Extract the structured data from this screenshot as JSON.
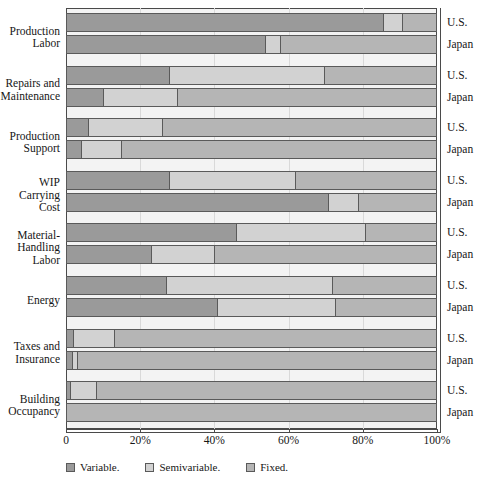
{
  "chart_data": {
    "type": "bar",
    "orientation": "horizontal",
    "stacked": true,
    "normalized": true,
    "title": "",
    "xlabel": "",
    "ylabel": "",
    "xlim": [
      0,
      100
    ],
    "grid": true,
    "legend_position": "bottom",
    "xticks": [
      "0",
      "20%",
      "40%",
      "60%",
      "80%",
      "100%"
    ],
    "xtick_values": [
      0,
      20,
      40,
      60,
      80,
      100
    ],
    "legend": [
      "Variable.",
      "Semivariable.",
      "Fixed."
    ],
    "series_names": [
      "Variable",
      "Semivariable",
      "Fixed"
    ],
    "colors": {
      "variable": "#9a9a9a",
      "semivariable": "#d2d2d2",
      "fixed": "#b5b5b5",
      "plot_background": "#f3f3f3",
      "frame": "#4a4a4a",
      "gridline": "#d9d9d9"
    },
    "categories": [
      "Production Labor",
      "Repairs and Maintenance",
      "Production Support",
      "WIP Carrying Cost",
      "Material-Handling Labor",
      "Energy",
      "Taxes and Insurance",
      "Building Occupancy"
    ],
    "countries": [
      "U.S.",
      "Japan"
    ],
    "groups": [
      {
        "category_lines": [
          "Production",
          "Labor"
        ],
        "bars": [
          {
            "country": "U.S.",
            "variable": 86,
            "semivariable": 5,
            "fixed": 9
          },
          {
            "country": "Japan",
            "variable": 54,
            "semivariable": 4,
            "fixed": 42
          }
        ]
      },
      {
        "category_lines": [
          "Repairs and",
          "Maintenance"
        ],
        "bars": [
          {
            "country": "U.S.",
            "variable": 28,
            "semivariable": 42,
            "fixed": 30
          },
          {
            "country": "Japan",
            "variable": 10,
            "semivariable": 20,
            "fixed": 70
          }
        ]
      },
      {
        "category_lines": [
          "Production",
          "Support"
        ],
        "bars": [
          {
            "country": "U.S.",
            "variable": 6,
            "semivariable": 20,
            "fixed": 74
          },
          {
            "country": "Japan",
            "variable": 4,
            "semivariable": 11,
            "fixed": 85
          }
        ]
      },
      {
        "category_lines": [
          "WIP",
          "Carrying",
          "Cost"
        ],
        "bars": [
          {
            "country": "U.S.",
            "variable": 28,
            "semivariable": 34,
            "fixed": 38
          },
          {
            "country": "Japan",
            "variable": 71,
            "semivariable": 8,
            "fixed": 21
          }
        ]
      },
      {
        "category_lines": [
          "Material-",
          "Handling",
          "Labor"
        ],
        "bars": [
          {
            "country": "U.S.",
            "variable": 46,
            "semivariable": 35,
            "fixed": 19
          },
          {
            "country": "Japan",
            "variable": 23,
            "semivariable": 17,
            "fixed": 60
          }
        ]
      },
      {
        "category_lines": [
          "Energy"
        ],
        "bars": [
          {
            "country": "U.S.",
            "variable": 27,
            "semivariable": 45,
            "fixed": 28
          },
          {
            "country": "Japan",
            "variable": 41,
            "semivariable": 32,
            "fixed": 27
          }
        ]
      },
      {
        "category_lines": [
          "Taxes and",
          "Insurance"
        ],
        "bars": [
          {
            "country": "U.S.",
            "variable": 2,
            "semivariable": 11,
            "fixed": 87
          },
          {
            "country": "Japan",
            "variable": 1.5,
            "semivariable": 1.5,
            "fixed": 97
          }
        ]
      },
      {
        "category_lines": [
          "Building",
          "Occupancy"
        ],
        "bars": [
          {
            "country": "U.S.",
            "variable": 1,
            "semivariable": 7,
            "fixed": 92
          },
          {
            "country": "Japan",
            "variable": 0,
            "semivariable": 0,
            "fixed": 100
          }
        ]
      }
    ]
  }
}
